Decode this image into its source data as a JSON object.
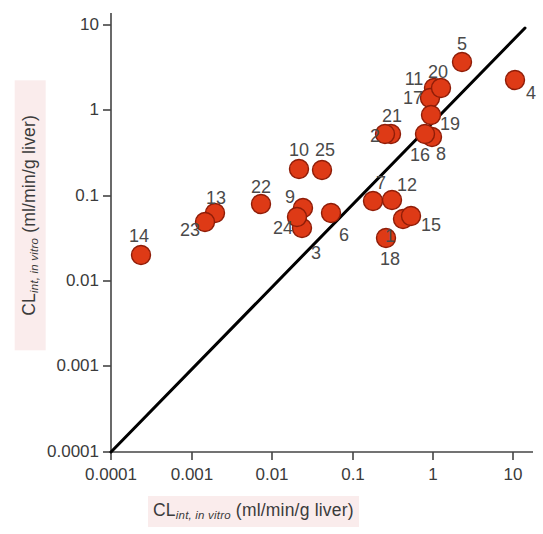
{
  "figure": {
    "width": 543,
    "height": 534,
    "background": "#ffffff",
    "marker_color": "#de3a16",
    "marker_edge_color": "#8f1d08",
    "line_color": "#000000",
    "axis_color": "#444444",
    "text_color": "#3b3b3b",
    "highlight_color": "#faecec"
  },
  "axes": {
    "x_title_prefix": "CL",
    "x_title_sub": "int, in vitro",
    "x_title_suffix": " (ml/min/g liver)",
    "y_title_prefix": "CL",
    "y_title_sub": "int, in vitro",
    "y_title_suffix": " (ml/min/g liver)",
    "x_ticks": [
      "0.0001",
      "0.001",
      "0.01",
      "0.1",
      "1",
      "10"
    ],
    "y_ticks": [
      "10",
      "1",
      "0.1",
      "0.01",
      "0.001",
      "0.0001"
    ],
    "xlim": [
      0.0001,
      10
    ],
    "ylim": [
      0.0001,
      10
    ],
    "xscale": "log",
    "yscale": "log",
    "grid": false,
    "identity_line": true
  },
  "chart_data": {
    "type": "scatter",
    "title": "",
    "xlabel": "CL int, in vitro (ml/min/g liver)",
    "ylabel": "CL int, in vitro (ml/min/g liver)",
    "xscale": "log",
    "yscale": "log",
    "xlim": [
      0.0001,
      10
    ],
    "ylim": [
      0.0001,
      10
    ],
    "grid": false,
    "legend": null,
    "annotations": [
      "identity line y = x from (0.0001, 0.0001) to (10, 10)"
    ],
    "points": [
      {
        "label": "1",
        "x": 0.3,
        "y": 0.047,
        "px": 403,
        "py": 219,
        "lx": 390,
        "ly": 236
      },
      {
        "label": "2",
        "x": 0.8,
        "y": 0.55,
        "px": 391,
        "py": 134,
        "lx": 375,
        "ly": 136
      },
      {
        "label": "3",
        "x": 0.024,
        "y": 0.033,
        "px": 302,
        "py": 228,
        "lx": 316,
        "ly": 253
      },
      {
        "label": "4",
        "x": 10.0,
        "y": 2.3,
        "px": 515,
        "py": 80,
        "lx": 531,
        "ly": 93
      },
      {
        "label": "5",
        "x": 2.6,
        "y": 3.4,
        "px": 462,
        "py": 62,
        "lx": 462,
        "ly": 44
      },
      {
        "label": "6",
        "x": 0.055,
        "y": 0.055,
        "px": 331,
        "py": 213,
        "lx": 344,
        "ly": 235
      },
      {
        "label": "7",
        "x": 0.26,
        "y": 0.072,
        "px": 373,
        "py": 201,
        "lx": 381,
        "ly": 183
      },
      {
        "label": "8",
        "x": 1.1,
        "y": 0.49,
        "px": 432,
        "py": 137,
        "lx": 441,
        "ly": 154
      },
      {
        "label": "9",
        "x": 0.025,
        "y": 0.056,
        "px": 303,
        "py": 208,
        "lx": 290,
        "ly": 197
      },
      {
        "label": "10",
        "x": 0.021,
        "y": 0.19,
        "px": 299,
        "py": 169,
        "lx": 299,
        "ly": 150
      },
      {
        "label": "11",
        "x": 1.2,
        "y": 1.7,
        "px": 434,
        "py": 88,
        "lx": 414,
        "ly": 79
      },
      {
        "label": "12",
        "x": 0.4,
        "y": 0.073,
        "px": 392,
        "py": 200,
        "lx": 407,
        "ly": 185
      },
      {
        "label": "13",
        "x": 0.0016,
        "y": 0.055,
        "px": 215,
        "py": 213,
        "lx": 216,
        "ly": 198
      },
      {
        "label": "14",
        "x": 0.00026,
        "y": 0.019,
        "px": 141,
        "py": 255,
        "lx": 139,
        "ly": 236
      },
      {
        "label": "15",
        "x": 0.56,
        "y": 0.05,
        "px": 411,
        "py": 216,
        "lx": 431,
        "ly": 225
      },
      {
        "label": "16",
        "x": 0.95,
        "y": 0.53,
        "px": 425,
        "py": 134,
        "lx": 420,
        "ly": 155
      },
      {
        "label": "17",
        "x": 1.1,
        "y": 1.2,
        "px": 430,
        "py": 98,
        "lx": 413,
        "ly": 98
      },
      {
        "label": "18",
        "x": 0.33,
        "y": 0.025,
        "px": 386,
        "py": 238,
        "lx": 390,
        "ly": 259
      },
      {
        "label": "19",
        "x": 1.2,
        "y": 0.79,
        "px": 431,
        "py": 115,
        "lx": 450,
        "ly": 124
      },
      {
        "label": "20",
        "x": 1.5,
        "y": 1.8,
        "px": 441,
        "py": 88,
        "lx": 438,
        "ly": 72
      },
      {
        "label": "21",
        "x": 0.72,
        "y": 0.57,
        "px": 385,
        "py": 134,
        "lx": 392,
        "ly": 116
      },
      {
        "label": "22",
        "x": 0.0066,
        "y": 0.074,
        "px": 261,
        "py": 204,
        "lx": 261,
        "ly": 187
      },
      {
        "label": "23",
        "x": 0.0014,
        "y": 0.043,
        "px": 205,
        "py": 222,
        "lx": 190,
        "ly": 230
      },
      {
        "label": "24",
        "x": 0.023,
        "y": 0.043,
        "px": 297,
        "py": 217,
        "lx": 283,
        "ly": 228
      },
      {
        "label": "25",
        "x": 0.044,
        "y": 0.19,
        "px": 322,
        "py": 170,
        "lx": 325,
        "ly": 150
      }
    ]
  },
  "x_tick_positions": [
    111,
    192,
    272,
    353,
    433,
    513
  ],
  "y_tick_positions": [
    25,
    110,
    196,
    281,
    366,
    452
  ]
}
